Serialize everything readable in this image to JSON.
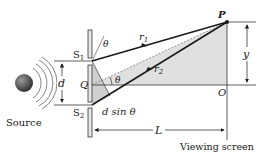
{
  "diagram": {
    "labels": {
      "P": "P",
      "S1": "S",
      "S1_sub": "1",
      "S2": "S",
      "S2_sub": "2",
      "Q": "Q",
      "O": "O",
      "d": "d",
      "d_sin_theta": "d sin θ",
      "theta_top": "θ",
      "theta_mid": "θ",
      "r1": "r",
      "r1_sub": "1",
      "r2": "r",
      "r2_sub": "2",
      "y": "y",
      "L": "L",
      "source": "Source",
      "viewing_screen": "Viewing screen"
    },
    "colors": {
      "line": "#1a1a1a",
      "shade": "#d9d9d9",
      "barrier_fill": "#e6e6e6",
      "source_dark": "#3a3a3a",
      "source_light": "#9a9a9a",
      "wave": "#555555"
    }
  }
}
